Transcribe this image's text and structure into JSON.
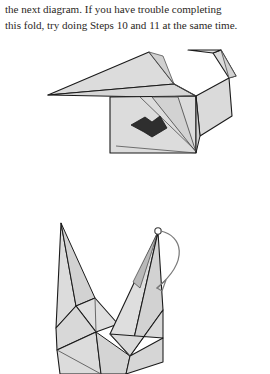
{
  "page": {
    "background_color": "#ffffff",
    "text_color": "#2b2724",
    "width": 270,
    "height": 374
  },
  "body_text": {
    "lines": [
      "the next diagram. If you have trouble completing",
      "this fold, try doing Steps 10 and 11 at the same time."
    ],
    "full_text": "the next diagram. If you have trouble completing this fold, try doing Steps 10 and 11 at the same time."
  },
  "figures": [
    {
      "id": "step-10",
      "name": "origami-crane-side-view-with-push-arrow",
      "description": "Folded paper crane form seen from the side with a large left wing, a hooked beak at upper right, and a solid black push-in arrow on the lower body panel",
      "paper_fill": "#d9d9d9",
      "paper_fill_light": "#e4e4e4",
      "paper_fill_shadow": "#c9c9c9",
      "outline_color": "#1a1a1a",
      "crease_color": "#4a4a4a",
      "arrow": {
        "type": "push-in-arrow",
        "fill": "#2e2e2e",
        "direction": "down-right"
      }
    },
    {
      "id": "step-11",
      "name": "origami-crane-with-rotation-arrow",
      "description": "Upright crane form with a tall pointed tail at left, a long neck rising to the right, and a curved rotation arrow sweeping clockwise from the head tip",
      "paper_fill": "#d9d9d9",
      "paper_fill_light": "#e6e6e6",
      "paper_fill_shadow": "#bdbdbd",
      "outline_color": "#1a1a1a",
      "crease_color": "#4a4a4a",
      "arrow": {
        "type": "curved-rotation-arrow",
        "stroke": "#6e6e6e",
        "direction": "clockwise",
        "pivot_marker": "small-open-circle"
      }
    }
  ]
}
